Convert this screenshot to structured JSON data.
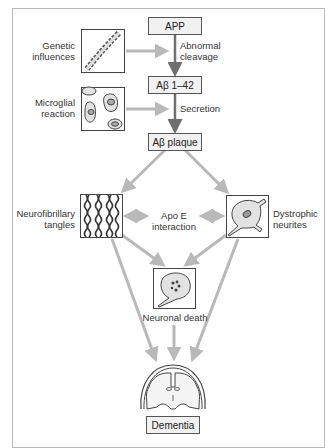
{
  "diagram": {
    "nodes": {
      "app": "APP",
      "abeta": "Aβ 1–42",
      "plaque": "Aβ plaque",
      "dementia": "Dementia"
    },
    "labels": {
      "genetic_1": "Genetic",
      "genetic_2": "influences",
      "abnormal_1": "Abnormal",
      "abnormal_2": "cleavage",
      "microglial_1": "Microglial",
      "microglial_2": "reaction",
      "secretion": "Secretion",
      "tangles_1": "Neurofibrillary",
      "tangles_2": "tangles",
      "apoe_1": "Apo E",
      "apoe_2": "interaction",
      "dystrophic_1": "Dystrophic",
      "dystrophic_2": "neurites",
      "neuronal_death": "Neuronal death"
    },
    "icons": [
      "dna-helix-icon",
      "microglia-cells-icon",
      "neurofibrillary-tangles-icon",
      "dystrophic-neuron-icon",
      "dying-neuron-icon",
      "brain-coronal-section-icon"
    ],
    "colors": {
      "arrow_dark": "#6f6f6f",
      "arrow_light": "#b9b9b9",
      "box_fill": "#f1f1f1",
      "cell_fill": "#e2e2e2"
    }
  }
}
